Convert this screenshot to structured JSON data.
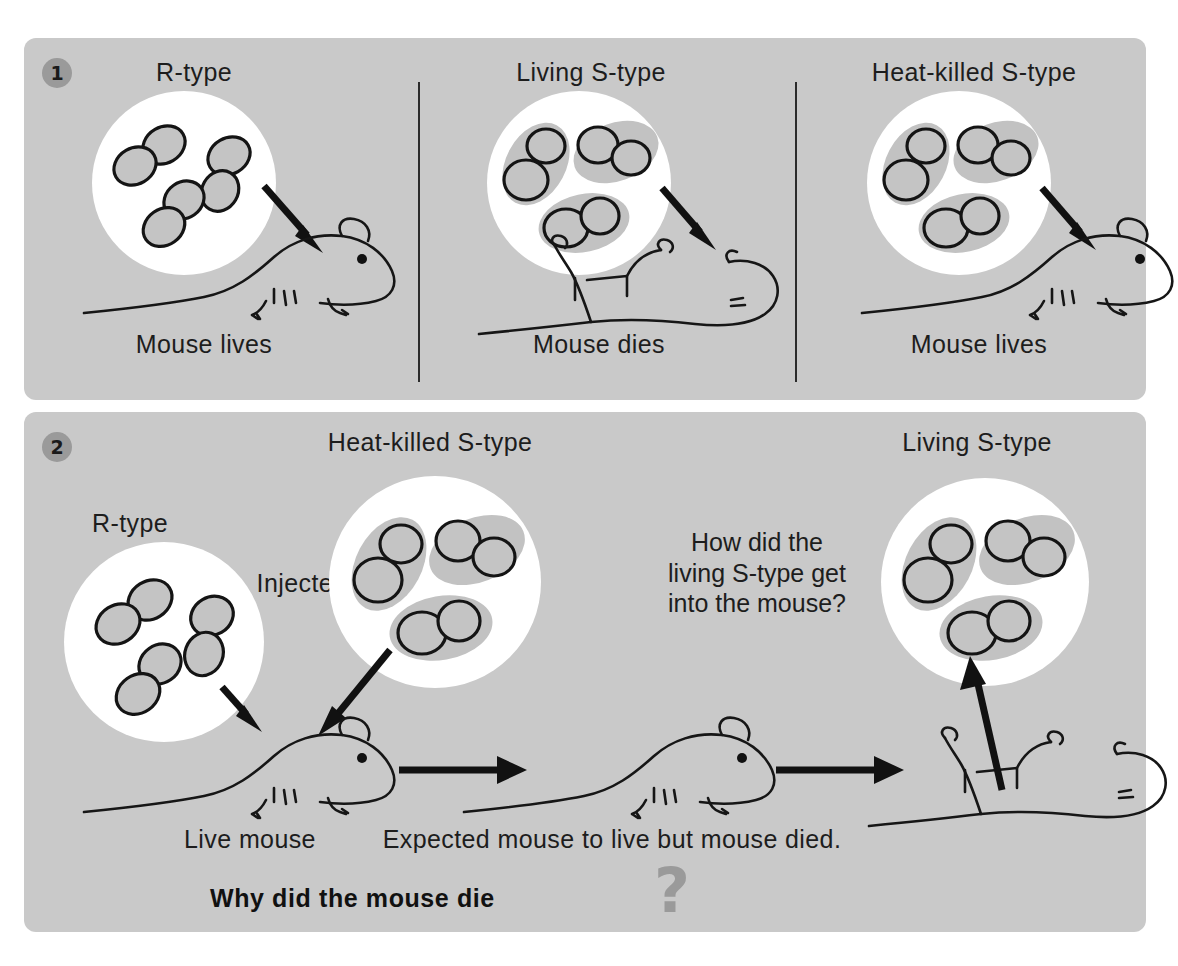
{
  "figure": {
    "title_visible": false,
    "background_color": "#ffffff",
    "panel_color": "#c9c9c9"
  },
  "panels": [
    {
      "number": "1",
      "badge_name": "panel-1-badge",
      "columns": [
        {
          "heading": "R-type",
          "outcome": "Mouse lives",
          "bacteria_type": "rough",
          "mouse_state": "alive"
        },
        {
          "heading": "Living S-type",
          "outcome": "Mouse dies",
          "bacteria_type": "smooth-encapsulated",
          "mouse_state": "dead"
        },
        {
          "heading": "Heat-killed S-type",
          "outcome": "Mouse lives",
          "bacteria_type": "smooth-encapsulated",
          "mouse_state": "alive"
        }
      ]
    },
    {
      "number": "2",
      "badge_name": "panel-2-badge",
      "labels": {
        "r_type": "R-type",
        "heat_killed": "Heat-killed S-type",
        "injected": "Injected",
        "living_s_type": "Living S-type",
        "question_inline": "How did the\nliving S-type get\ninto the mouse?",
        "live_mouse": "Live mouse",
        "expected": "Expected mouse to live but mouse died.",
        "why_bold": "Why did the mouse die",
        "question_mark": "?"
      }
    }
  ],
  "colors": {
    "panel": "#c9c9c9",
    "badge": "#9a9a9a",
    "ink": "#1d1d1d",
    "dish": "#ffffff",
    "capsule": "#c2c2c2",
    "cell_fill": "#c4c4c4",
    "question_mark": "#9a9a9a"
  }
}
